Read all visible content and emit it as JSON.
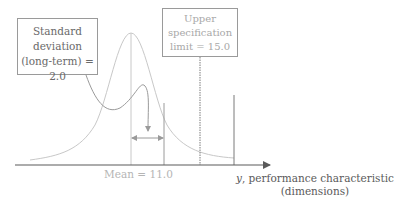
{
  "diagram": {
    "type": "normal-distribution-spec-limit",
    "std_dev_box": {
      "line1": "Standard",
      "line2": "deviation",
      "line3": "(long-term) = 2.0"
    },
    "usl_box": {
      "line1": "Upper",
      "line2": "specification",
      "line3": "limit = 15.0"
    },
    "mean_label": "Mean = 11.0",
    "x_axis": {
      "variable": "y",
      "label_rest": ", performance characteristic",
      "label_line2": "(dimensions)"
    },
    "values": {
      "mean": 11.0,
      "std_dev_long_term": 2.0,
      "upper_spec_limit": 15.0
    },
    "colors": {
      "curve": "#c8c8c8",
      "axis": "#5a5a5a",
      "arrow": "#9a9a9a",
      "box_border": "#9a9a9a"
    }
  }
}
